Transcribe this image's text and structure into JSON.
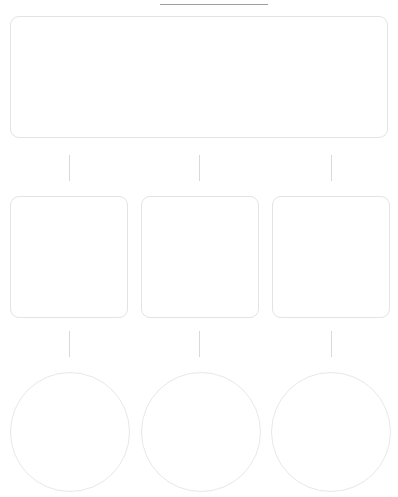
{
  "diagram": {
    "title": "",
    "header": {
      "clipped_glyph": "",
      "rule": ""
    },
    "root": {
      "label": "",
      "shape": "rounded-rectangle"
    },
    "branches": [
      {
        "label": "",
        "shape": "rounded-square"
      },
      {
        "label": "",
        "shape": "rounded-square"
      },
      {
        "label": "",
        "shape": "rounded-square"
      }
    ],
    "leaves": [
      {
        "label": "",
        "shape": "circle"
      },
      {
        "label": "",
        "shape": "circle"
      },
      {
        "label": "",
        "shape": "circle"
      }
    ],
    "connectors": {
      "upper": [
        "",
        "",
        ""
      ],
      "lower": [
        "",
        "",
        ""
      ]
    },
    "colors": {
      "background": "#ffffff",
      "node_border": "#e3e3e3",
      "circle_border": "#e8e8e8",
      "connector": "#d9d9d9",
      "rule": "#9e9e9e"
    }
  }
}
